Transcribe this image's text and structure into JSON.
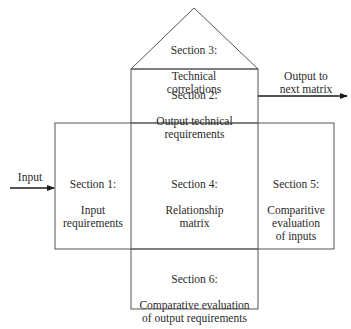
{
  "diagram": {
    "type": "house-of-quality",
    "sections": [
      {
        "id": "section-1",
        "title": "Section 1:",
        "text": "Input\nrequirements"
      },
      {
        "id": "section-2",
        "title": "Section 2:",
        "text": "Output technical\nrequirements"
      },
      {
        "id": "section-3",
        "title": "Section 3:",
        "text": "Technical\ncorrelations"
      },
      {
        "id": "section-4",
        "title": "Section 4:",
        "text": "Relationship\nmatrix"
      },
      {
        "id": "section-5",
        "title": "Section 5:",
        "text": "Comparitive\nevaluation\nof inputs"
      },
      {
        "id": "section-6",
        "title": "Section 6:",
        "text": "Comparative evaluation\nof output requirements"
      }
    ],
    "arrows": {
      "input": {
        "label": "Input"
      },
      "output": {
        "label": "Output to\nnext matrix"
      }
    },
    "colors": {
      "line": "#555555",
      "arrow": "#1a1a1a",
      "text": "#2a2a2a"
    }
  }
}
